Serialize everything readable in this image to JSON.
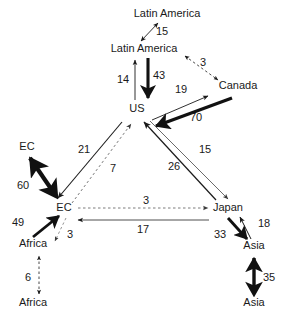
{
  "diagram": {
    "type": "flow-diagram",
    "title": "",
    "background_color": "#ffffff",
    "text_color": "#1a1a1a",
    "nodes": [
      {
        "id": "latin-america-top",
        "label": "Latin America",
        "x": 167,
        "y": 17
      },
      {
        "id": "latin-america",
        "label": "Latin America",
        "x": 144,
        "y": 52
      },
      {
        "id": "canada",
        "label": "Canada",
        "x": 238,
        "y": 89
      },
      {
        "id": "us",
        "label": "US",
        "x": 137,
        "y": 112
      },
      {
        "id": "ec-outer",
        "label": "EC",
        "x": 27,
        "y": 150
      },
      {
        "id": "ec",
        "label": "EC",
        "x": 64,
        "y": 211
      },
      {
        "id": "japan",
        "label": "Japan",
        "x": 228,
        "y": 211
      },
      {
        "id": "africa",
        "label": "Africa",
        "x": 33,
        "y": 247
      },
      {
        "id": "africa-outer",
        "label": "Africa",
        "x": 33,
        "y": 306
      },
      {
        "id": "asia",
        "label": "Asia",
        "x": 254,
        "y": 249
      },
      {
        "id": "asia-outer",
        "label": "Asia",
        "x": 254,
        "y": 306
      }
    ],
    "edges": [
      {
        "id": "edge-latin-america-pair",
        "from": "latin-america",
        "to": "latin-america-top",
        "value": "15",
        "label_x": 162,
        "label_y": 35,
        "style": "thin-solid-double"
      },
      {
        "id": "edge-latin-america-canada",
        "from": "latin-america",
        "to": "canada",
        "value": "3",
        "label_x": 203,
        "label_y": 66,
        "style": "thin-dashed-double"
      },
      {
        "id": "edge-us-to-latin-america",
        "from": "us",
        "to": "latin-america",
        "value": "14",
        "label_x": 123,
        "label_y": 83,
        "style": "thin-solid"
      },
      {
        "id": "edge-latin-america-to-us",
        "from": "latin-america",
        "to": "us",
        "value": "43",
        "label_x": 152,
        "label_y": 79,
        "style": "thick-solid"
      },
      {
        "id": "edge-us-to-canada",
        "from": "us",
        "to": "canada",
        "value": "19",
        "label_x": 181,
        "label_y": 93,
        "style": "thin-solid"
      },
      {
        "id": "edge-canada-to-us",
        "from": "canada",
        "to": "us",
        "value": "70",
        "label_x": 196,
        "label_y": 118,
        "style": "thick-solid"
      },
      {
        "id": "edge-ec-pair",
        "from": "ec",
        "to": "ec-outer",
        "value": "60",
        "label_x": 25,
        "label_y": 188,
        "style": "thick-solid-double"
      },
      {
        "id": "edge-us-to-ec",
        "from": "us",
        "to": "ec",
        "value": "21",
        "label_x": 84,
        "label_y": 153,
        "style": "thin-solid"
      },
      {
        "id": "edge-ec-to-us",
        "from": "ec",
        "to": "us",
        "value": "7",
        "label_x": 112,
        "label_y": 172,
        "style": "thin-dashed"
      },
      {
        "id": "edge-us-to-japan",
        "from": "us",
        "to": "japan",
        "value": "15",
        "label_x": 204,
        "label_y": 153,
        "style": "thin-solid"
      },
      {
        "id": "edge-japan-to-us",
        "from": "japan",
        "to": "us",
        "value": "26",
        "label_x": 173,
        "label_y": 170,
        "style": "thin-solid"
      },
      {
        "id": "edge-ec-to-japan",
        "from": "ec",
        "to": "japan",
        "value": "3",
        "label_x": 146,
        "label_y": 203,
        "style": "thin-dashed"
      },
      {
        "id": "edge-japan-to-ec",
        "from": "japan",
        "to": "ec",
        "value": "17",
        "label_x": 143,
        "label_y": 232,
        "style": "thin-solid"
      },
      {
        "id": "edge-africa-to-ec",
        "from": "africa",
        "to": "ec",
        "value": "49",
        "label_x": 36,
        "label_y": 224,
        "style": "thick-solid"
      },
      {
        "id": "edge-ec-to-africa",
        "from": "ec",
        "to": "africa",
        "value": "3",
        "label_x": 68,
        "label_y": 238,
        "style": "thin-dashed"
      },
      {
        "id": "edge-africa-pair",
        "from": "africa-outer",
        "to": "africa",
        "value": "6",
        "label_x": 29,
        "label_y": 281,
        "style": "thin-dashed-double"
      },
      {
        "id": "edge-japan-to-asia",
        "from": "japan",
        "to": "asia",
        "value": "33",
        "label_x": 224,
        "label_y": 238,
        "style": "thick-solid"
      },
      {
        "id": "edge-asia-to-japan",
        "from": "asia",
        "to": "japan",
        "value": "18",
        "label_x": 262,
        "label_y": 226,
        "style": "thin-solid"
      },
      {
        "id": "edge-asia-pair",
        "from": "asia-outer",
        "to": "asia",
        "value": "35",
        "label_x": 268,
        "label_y": 281,
        "style": "thick-solid-double"
      }
    ]
  }
}
